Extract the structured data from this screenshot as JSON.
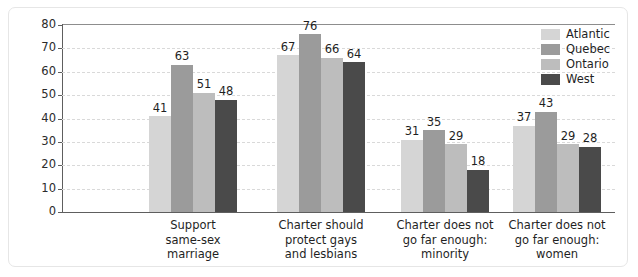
{
  "chart_data": {
    "type": "bar",
    "title": "",
    "xlabel": "",
    "ylabel": "Per cent",
    "ylim": [
      0,
      80
    ],
    "yticks": [
      0,
      10,
      20,
      30,
      40,
      50,
      60,
      70,
      80
    ],
    "grid": true,
    "legend_position": "top-right",
    "categories": [
      "Support\nsame-sex\nmarriage",
      "Charter should\nprotect gays\nand lesbians",
      "Charter does not\ngo far enough:\nminority",
      "Charter does not\ngo far enough:\nwomen"
    ],
    "series": [
      {
        "name": "Atlantic",
        "color": "#d5d5d5",
        "values": [
          41,
          67,
          31,
          37
        ]
      },
      {
        "name": "Quebec",
        "color": "#9b9b9b",
        "values": [
          63,
          76,
          35,
          43
        ]
      },
      {
        "name": "Ontario",
        "color": "#bdbdbd",
        "values": [
          51,
          66,
          29,
          29
        ]
      },
      {
        "name": "West",
        "color": "#4a4a4a",
        "values": [
          48,
          64,
          18,
          28
        ]
      }
    ]
  },
  "legend": {
    "items": [
      {
        "label": "Atlantic",
        "color": "#d5d5d5"
      },
      {
        "label": "Quebec",
        "color": "#9b9b9b"
      },
      {
        "label": "Ontario",
        "color": "#bdbdbd"
      },
      {
        "label": "West",
        "color": "#4a4a4a"
      }
    ]
  },
  "axis": {
    "y_title": "Per cent",
    "y_tick_labels": [
      "80",
      "70",
      "60",
      "50",
      "40",
      "30",
      "20",
      "10",
      "0"
    ]
  }
}
